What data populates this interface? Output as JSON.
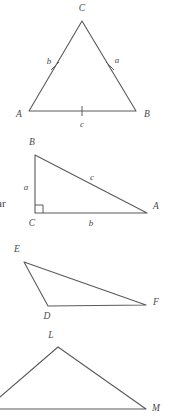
{
  "page": {
    "width": 169,
    "height": 420,
    "background_color": "#ffffff",
    "line_color": "#5a5a5a",
    "label_color": "#4a4a4a"
  },
  "stray_text": {
    "fragment": "ar",
    "x": 0,
    "y": 203
  },
  "figures": [
    {
      "id": "triangle-abc-isosceles",
      "name": "isosceles-triangle-abc",
      "vertices": [
        {
          "label": "C",
          "x": 82,
          "y": 21,
          "label_x": 82,
          "label_y": 9
        },
        {
          "label": "A",
          "x": 29,
          "y": 111,
          "label_x": 19,
          "label_y": 115
        },
        {
          "label": "B",
          "x": 136,
          "y": 111,
          "label_x": 147,
          "label_y": 115
        }
      ],
      "side_labels": [
        {
          "label": "b",
          "x": 49,
          "y": 62
        },
        {
          "label": "a",
          "x": 117,
          "y": 61
        },
        {
          "label": "c",
          "x": 82,
          "y": 125
        }
      ],
      "tick_marks": [
        {
          "side": "CA",
          "x": 55,
          "y": 66,
          "angle": -60
        },
        {
          "side": "CB",
          "x": 110,
          "y": 66,
          "angle": 60
        },
        {
          "side": "AB",
          "x": 82,
          "y": 111,
          "angle": 0
        }
      ],
      "right_angle": null
    },
    {
      "id": "triangle-abc-right",
      "name": "right-triangle-abc",
      "vertices": [
        {
          "label": "B",
          "x": 35,
          "y": 155,
          "label_x": 32,
          "label_y": 143
        },
        {
          "label": "C",
          "x": 35,
          "y": 213,
          "label_x": 32,
          "label_y": 224
        },
        {
          "label": "A",
          "x": 147,
          "y": 213,
          "label_x": 156,
          "label_y": 207
        }
      ],
      "side_labels": [
        {
          "label": "a",
          "x": 26,
          "y": 188
        },
        {
          "label": "c",
          "x": 92,
          "y": 178
        },
        {
          "label": "b",
          "x": 91,
          "y": 224
        }
      ],
      "tick_marks": [],
      "right_angle": {
        "vertex": "C",
        "x": 35,
        "y": 213,
        "size": 8
      }
    },
    {
      "id": "triangle-def",
      "name": "scalene-triangle-def",
      "vertices": [
        {
          "label": "E",
          "x": 24,
          "y": 262,
          "label_x": 17,
          "label_y": 250
        },
        {
          "label": "D",
          "x": 48,
          "y": 306,
          "label_x": 47,
          "label_y": 317
        },
        {
          "label": "F",
          "x": 146,
          "y": 305,
          "label_x": 156,
          "label_y": 303
        }
      ],
      "side_labels": [],
      "tick_marks": [],
      "right_angle": null
    },
    {
      "id": "triangle-lm-cropped",
      "name": "cropped-triangle-lm",
      "vertices": [
        {
          "label": "L",
          "x": 58,
          "y": 347,
          "label_x": 51,
          "label_y": 336
        },
        {
          "label": "M",
          "x": 146,
          "y": 409,
          "label_x": 156,
          "label_y": 409
        },
        {
          "label": "",
          "x": -14,
          "y": 409,
          "label_x": null,
          "label_y": null
        }
      ],
      "side_labels": [],
      "tick_marks": [],
      "right_angle": null,
      "note": "clipped at left and bottom edges of the page"
    }
  ]
}
